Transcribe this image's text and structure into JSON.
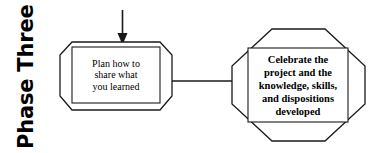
{
  "diagram": {
    "phase_label": "Phase Three",
    "stroke_color": "#1a1a1a",
    "fill_color": "#ffffff",
    "background_color": "#ffffff",
    "nodes": [
      {
        "id": "plan-node",
        "shape": "elongated-octagon",
        "text_lines": [
          "Plan how to",
          "share what",
          "you learned"
        ],
        "text_weight": "normal"
      },
      {
        "id": "celebrate-node",
        "shape": "octagon",
        "text_lines": [
          "Celebrate the",
          "project and the",
          "knowledge, skills,",
          "and dispositions",
          "developed"
        ],
        "text_weight": "bold"
      }
    ],
    "connectors": [
      {
        "id": "entry-arrow",
        "direction": "down",
        "from": "above",
        "to": "plan-node"
      },
      {
        "id": "plan-to-celebrate-arrow",
        "direction": "right",
        "from": "plan-node",
        "to": "celebrate-node"
      }
    ]
  }
}
